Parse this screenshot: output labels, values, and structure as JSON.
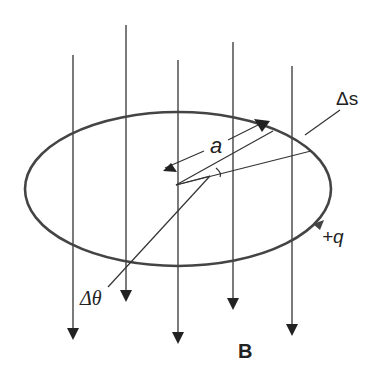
{
  "diagram": {
    "labels": {
      "arc_length": "Δs",
      "radius": "a",
      "angle": "Δθ",
      "charge": "+q",
      "field": "B"
    },
    "field_lines": [
      {
        "x": 73,
        "top": 55,
        "tip": 340
      },
      {
        "x": 126,
        "top": 25,
        "tip": 302
      },
      {
        "x": 178,
        "top": 60,
        "tip": 344
      },
      {
        "x": 233,
        "top": 42,
        "tip": 310
      },
      {
        "x": 292,
        "top": 66,
        "tip": 336
      }
    ],
    "orbit": {
      "cx": 178,
      "cy": 189,
      "rx": 153,
      "ry": 77
    },
    "colors": {
      "line": "#333333",
      "orbit": "#444444"
    }
  }
}
